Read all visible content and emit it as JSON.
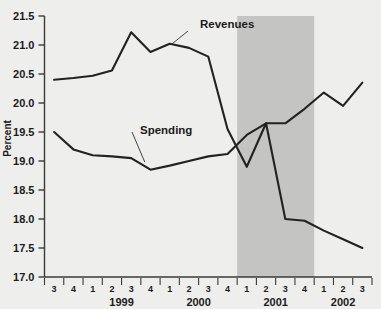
{
  "chart_data": {
    "type": "line",
    "title": "",
    "xlabel": "",
    "ylabel": "Percent",
    "ylim": [
      17.0,
      21.5
    ],
    "ytick_labels": [
      "21.5",
      "21.0",
      "20.5",
      "20.0",
      "19.5",
      "19.0",
      "18.5",
      "18.0",
      "17.5",
      "17.0"
    ],
    "ytick_values": [
      21.5,
      21.0,
      20.5,
      20.0,
      19.5,
      19.0,
      18.5,
      18.0,
      17.5,
      17.0
    ],
    "grid": false,
    "legend_position": "inline-annotations",
    "x": [
      "1998Q3",
      "1998Q4",
      "1999Q1",
      "1999Q2",
      "1999Q3",
      "1999Q4",
      "2000Q1",
      "2000Q2",
      "2000Q3",
      "2000Q4",
      "2001Q1",
      "2001Q2",
      "2001Q3",
      "2001Q4",
      "2002Q1",
      "2002Q2",
      "2002Q3"
    ],
    "quarter_labels": [
      "3",
      "4",
      "1",
      "2",
      "3",
      "4",
      "1",
      "2",
      "3",
      "4",
      "1",
      "2",
      "3",
      "4",
      "1",
      "2",
      "3"
    ],
    "year_labels": [
      {
        "label": "1999",
        "center_index": 3.5
      },
      {
        "label": "2000",
        "center_index": 7.5
      },
      {
        "label": "2001",
        "center_index": 11.5
      },
      {
        "label": "2002",
        "center_index": 15.0
      }
    ],
    "series": [
      {
        "name": "Revenues",
        "label_anchor_index": 6.1,
        "values": [
          20.4,
          20.43,
          20.47,
          20.56,
          21.22,
          20.88,
          21.02,
          20.95,
          20.8,
          19.55,
          18.9,
          19.65,
          18.0,
          17.97,
          17.8,
          17.65,
          17.5
        ]
      },
      {
        "name": "Spending",
        "label_anchor_index": 4.6,
        "values": [
          19.5,
          19.2,
          19.1,
          19.08,
          19.05,
          18.85,
          18.92,
          19.0,
          19.08,
          19.12,
          19.45,
          19.65,
          19.65,
          19.9,
          20.18,
          19.95,
          20.35
        ]
      }
    ],
    "shaded_regions": [
      {
        "name": "recession",
        "start_index": 9.5,
        "end_index": 13.5,
        "color": "#c4c4c2"
      }
    ],
    "colors": {
      "background": "#eeeeec",
      "line": "#222222",
      "axis": "#3a3a3a",
      "shade": "#c4c4c2",
      "text": "#1b1b1b"
    }
  }
}
